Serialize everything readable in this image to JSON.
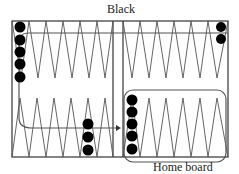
{
  "diagram": {
    "title_top": "Black",
    "title_bottom": "Home board",
    "colors": {
      "line": "#555555",
      "border": "#333333",
      "checker": "#000000",
      "background": "#ffffff"
    },
    "board": {
      "points_per_quadrant": 6,
      "checkers": [
        {
          "area": "top-left-point-1",
          "count": 5
        },
        {
          "area": "top-right-point-6",
          "count": 2
        },
        {
          "area": "bottom-left-point-5",
          "count": 3
        },
        {
          "area": "bottom-right-point-1",
          "count": 5
        }
      ],
      "highlight": "home-board",
      "path_arrow": "movement-direction-arrow"
    }
  }
}
